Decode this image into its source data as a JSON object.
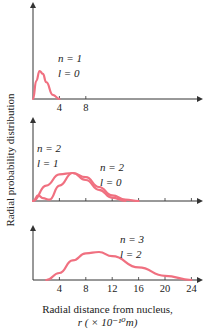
{
  "chart_data": {
    "type": "line",
    "title": "",
    "xlabel": "Radial distance from nucleus,",
    "xlabel_unit": "r (× 10⁻¹⁰ m)",
    "ylabel": "Radial probability distribution",
    "xlim": [
      0,
      26
    ],
    "curve_color": "#f07080",
    "grid": false,
    "panels": [
      {
        "name": "n=1,l=0",
        "annotation": {
          "n": "n = 1",
          "l": "l = 0"
        },
        "ticks": [
          4,
          8
        ],
        "tick_labels": [
          "4",
          "8"
        ],
        "series": [
          {
            "name": "n=1, l=0",
            "x": [
              0,
              0.5,
              1,
              1.5,
              2,
              3,
              4
            ],
            "y": [
              0,
              0.65,
              1.0,
              0.9,
              0.6,
              0.15,
              0.0
            ]
          }
        ]
      },
      {
        "name": "n=2",
        "annotation": [
          {
            "n": "n = 2",
            "l": "l = 1"
          },
          {
            "n": "n = 2",
            "l": "l = 0"
          }
        ],
        "ticks": [
          4,
          8,
          12,
          16,
          20,
          24
        ],
        "tick_labels": [],
        "series": [
          {
            "name": "n=2, l=1",
            "x": [
              0,
              2,
              4,
              6,
              8,
              10,
              12,
              14
            ],
            "y": [
              0,
              0.55,
              0.95,
              1.0,
              0.75,
              0.4,
              0.12,
              0.0
            ]
          },
          {
            "name": "n=2, l=0",
            "x": [
              0,
              0.8,
              1.5,
              2.5,
              4,
              6,
              8,
              10,
              12,
              14,
              16
            ],
            "y": [
              0,
              0.2,
              0.1,
              0.05,
              0.55,
              1.0,
              0.85,
              0.5,
              0.2,
              0.05,
              0.0
            ]
          }
        ]
      },
      {
        "name": "n=3,l=2",
        "annotation": {
          "n": "n = 3",
          "l": "l = 2"
        },
        "ticks": [
          4,
          8,
          12,
          16,
          20,
          24
        ],
        "tick_labels": [
          "4",
          "8",
          "12",
          "16",
          "20",
          "24"
        ],
        "series": [
          {
            "name": "n=3, l=2",
            "x": [
              2,
              4,
              6,
              8,
              10,
              12,
              16,
              20,
              24
            ],
            "y": [
              0,
              0.25,
              0.7,
              0.95,
              1.0,
              0.85,
              0.45,
              0.15,
              0.0
            ]
          }
        ]
      }
    ]
  },
  "labels": {
    "y_axis": "Radial probability distribution",
    "x_title_line1": "Radial distance from nucleus,",
    "x_title_line2": "r ( × 10⁻¹⁰m)"
  }
}
